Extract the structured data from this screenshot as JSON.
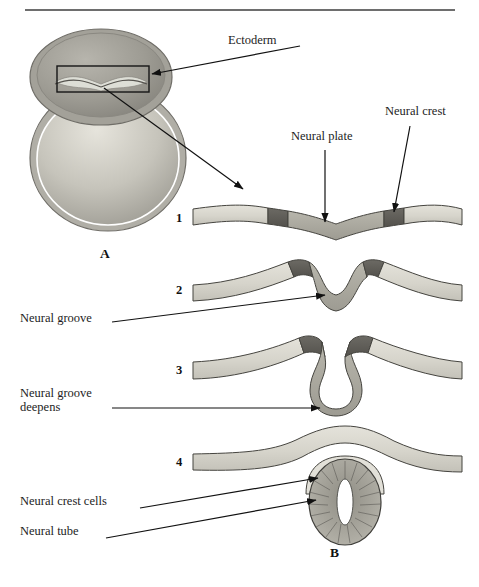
{
  "figure": {
    "title_rule": true,
    "panels": [
      {
        "id": "A",
        "label": "A",
        "x": 100,
        "y": 253,
        "caption": "whole embryo with neural plate region boxed"
      },
      {
        "id": "B",
        "label": "B",
        "x": 330,
        "y": 552,
        "caption": "four-stage neurulation sequence"
      }
    ],
    "colors": {
      "ectoderm": "#d8d6cd",
      "neural_plate": "#a9a79e",
      "neural_crest": "#5f5d58",
      "neural_tube_fill": "#9b998f",
      "lumen": "#ffffff",
      "outline": "#3c3b38",
      "leader_line": "#111111",
      "rule": "#6e6e6e",
      "embryo_dark": "#9a9890",
      "embryo_light": "#cfcdc5"
    }
  },
  "labels": {
    "ectoderm": "Ectoderm",
    "neural_plate": "Neural plate",
    "neural_crest": "Neural crest",
    "neural_groove": "Neural groove",
    "neural_groove_deepens_line1": "Neural groove",
    "neural_groove_deepens_line2": "deepens",
    "neural_crest_cells": "Neural crest cells",
    "neural_tube": "Neural tube"
  },
  "stages": [
    {
      "number": "1",
      "name": "neural-plate-flat",
      "description": "Flat neural plate flanked by neural crest bands in surface ectoderm",
      "y": 218
    },
    {
      "number": "2",
      "name": "neural-groove-forming",
      "description": "Neural plate invaginates to form the neural groove; crest at the rising folds",
      "y": 290
    },
    {
      "number": "3",
      "name": "neural-groove-deepens",
      "description": "Neural folds rise and approach; groove deepens into a U",
      "y": 370
    },
    {
      "number": "4",
      "name": "neural-tube-closed",
      "description": "Neural tube closes and separates; neural crest cells lie between tube and ectoderm",
      "y": 462
    }
  ],
  "annotations": {
    "ectoderm": {
      "label_x": 228,
      "label_y": 41,
      "points_to": "embryo-neural-plate-box"
    },
    "neural_plate": {
      "label_x": 291,
      "label_y": 137,
      "points_to": "stage1-neural-plate"
    },
    "neural_crest": {
      "label_x": 385,
      "label_y": 112,
      "points_to": "stage1-right-crest"
    },
    "neural_groove": {
      "label_x": 20,
      "label_y": 318,
      "points_to": "stage2-groove"
    },
    "neural_groove_deepens": {
      "label_x": 20,
      "label_y": 400,
      "points_to": "stage3-groove"
    },
    "neural_crest_cells": {
      "label_x": 20,
      "label_y": 502,
      "points_to": "stage4-crest-cells"
    },
    "neural_tube": {
      "label_x": 20,
      "label_y": 532,
      "points_to": "stage4-neural-tube"
    }
  }
}
